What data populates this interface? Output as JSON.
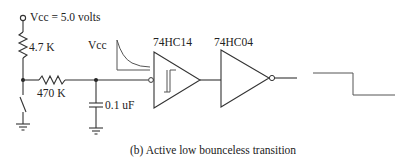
{
  "figure": {
    "caption": "(b) Active low bounceless transition",
    "supply_label": "Vcc = 5.0 volts",
    "waveform_label": "Vcc"
  },
  "components": {
    "pullup_resistor": {
      "value": "4.7 K"
    },
    "series_resistor": {
      "value": "470 K"
    },
    "capacitor": {
      "value": "0.1 uF"
    },
    "schmitt_inverter": {
      "part": "74HC14"
    },
    "inverter": {
      "part": "74HC04"
    }
  },
  "colors": {
    "line": "#333333",
    "text": "#222222",
    "background": "#ffffff"
  }
}
